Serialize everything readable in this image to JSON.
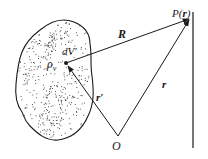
{
  "diagram": {
    "colors": {
      "ink": "#1a1a1a",
      "background": "#ffffff",
      "dots": "#333333"
    },
    "labels": {
      "volume_element": "dV′",
      "charge_density": "ρ",
      "charge_density_sub": "v",
      "field_point_prefix": "P(",
      "field_point_vector": "r",
      "field_point_suffix": ")",
      "separation_vector": "R",
      "field_position_vector": "r",
      "source_position_vector": "r′",
      "origin": "O"
    }
  }
}
